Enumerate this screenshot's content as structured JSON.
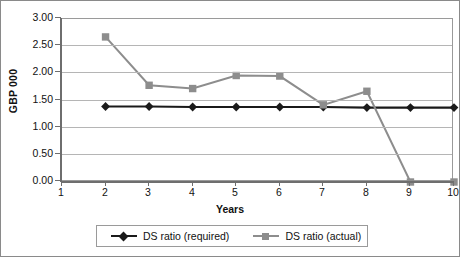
{
  "chart_data": {
    "type": "line",
    "title": "",
    "xlabel": "Years",
    "ylabel": "GBP 000",
    "x": [
      1,
      2,
      3,
      4,
      5,
      6,
      7,
      8,
      9,
      10
    ],
    "xtick_labels": [
      "1",
      "2",
      "3",
      "4",
      "5",
      "6",
      "7",
      "8",
      "9",
      "10"
    ],
    "ytick_labels": [
      "0.00",
      "0.50",
      "1.00",
      "1.50",
      "2.00",
      "2.50",
      "3.00"
    ],
    "ytick_values": [
      0.0,
      0.5,
      1.0,
      1.5,
      2.0,
      2.5,
      3.0
    ],
    "ylim": [
      0.0,
      3.0
    ],
    "xlim": [
      1,
      10
    ],
    "grid": "horizontal",
    "legend_position": "bottom-center",
    "series": [
      {
        "name": "DS ratio (required)",
        "color": "#1a1a1a",
        "marker": "diamond",
        "x": [
          2,
          3,
          4,
          5,
          6,
          7,
          8,
          9,
          10
        ],
        "values": [
          1.39,
          1.39,
          1.38,
          1.38,
          1.38,
          1.38,
          1.37,
          1.37,
          1.37
        ]
      },
      {
        "name": "DS ratio (actual)",
        "color": "#8d8d8d",
        "marker": "square",
        "x": [
          2,
          3,
          4,
          5,
          6,
          7,
          8,
          9,
          10
        ],
        "values": [
          2.67,
          1.78,
          1.72,
          1.96,
          1.95,
          1.42,
          1.67,
          0.0,
          0.0
        ]
      }
    ]
  },
  "legend": {
    "entries": [
      {
        "label": "DS ratio (required)"
      },
      {
        "label": "DS ratio (actual)"
      }
    ]
  },
  "axes": {
    "y_title": "GBP 000",
    "x_title": "Years"
  },
  "colors": {
    "series_required": "#1a1a1a",
    "series_actual": "#8d8d8d",
    "grid": "#b5b5b5",
    "axis": "#6e6e6e",
    "border": "#8a8a8a"
  }
}
